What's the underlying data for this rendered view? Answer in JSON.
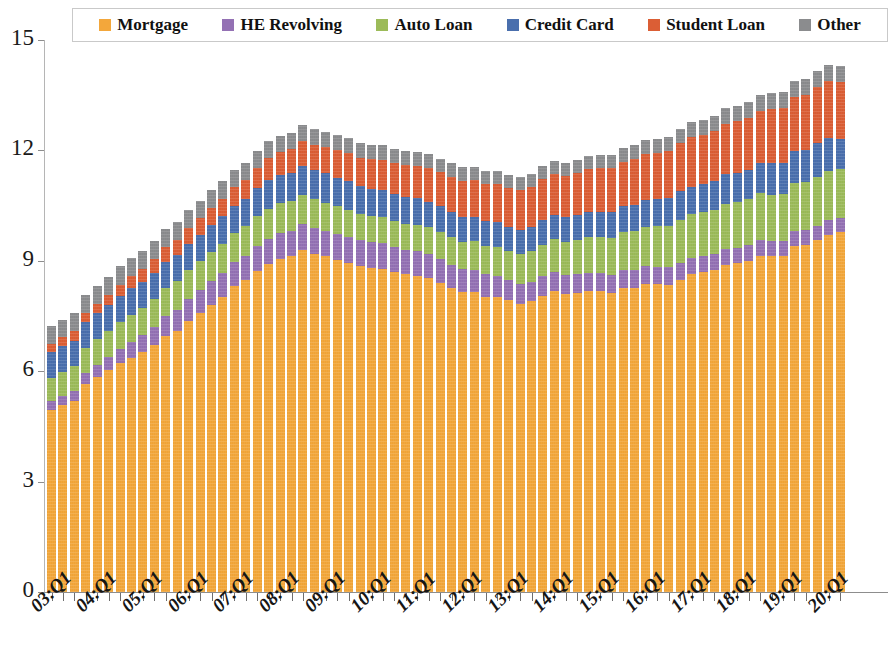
{
  "chart_data": {
    "type": "bar",
    "stacked": true,
    "title": "",
    "subtitle": "",
    "xlabel": "",
    "ylabel": "",
    "ylim": [
      0,
      15
    ],
    "yticks": [
      0,
      3,
      6,
      9,
      12,
      15
    ],
    "ytick_labels": [
      "0",
      "3",
      "6",
      "9",
      "12",
      "15"
    ],
    "grid": false,
    "legend_position": "top",
    "x_tick_labels": [
      "03:Q1",
      "04:Q1",
      "05:Q1",
      "06:Q1",
      "07:Q1",
      "08:Q1",
      "09:Q1",
      "10:Q1",
      "11:Q1",
      "12:Q1",
      "13:Q1",
      "14:Q1",
      "15:Q1",
      "16:Q1",
      "17:Q1",
      "18:Q1",
      "19:Q1",
      "20:Q1"
    ],
    "x_tick_every": 4,
    "categories": [
      "03:Q1",
      "03:Q2",
      "03:Q3",
      "03:Q4",
      "04:Q1",
      "04:Q2",
      "04:Q3",
      "04:Q4",
      "05:Q1",
      "05:Q2",
      "05:Q3",
      "05:Q4",
      "06:Q1",
      "06:Q2",
      "06:Q3",
      "06:Q4",
      "07:Q1",
      "07:Q2",
      "07:Q3",
      "07:Q4",
      "08:Q1",
      "08:Q2",
      "08:Q3",
      "08:Q4",
      "09:Q1",
      "09:Q2",
      "09:Q3",
      "09:Q4",
      "10:Q1",
      "10:Q2",
      "10:Q3",
      "10:Q4",
      "11:Q1",
      "11:Q2",
      "11:Q3",
      "11:Q4",
      "12:Q1",
      "12:Q2",
      "12:Q3",
      "12:Q4",
      "13:Q1",
      "13:Q2",
      "13:Q3",
      "13:Q4",
      "14:Q1",
      "14:Q2",
      "14:Q3",
      "14:Q4",
      "15:Q1",
      "15:Q2",
      "15:Q3",
      "15:Q4",
      "16:Q1",
      "16:Q2",
      "16:Q3",
      "16:Q4",
      "17:Q1",
      "17:Q2",
      "17:Q3",
      "17:Q4",
      "18:Q1",
      "18:Q2",
      "18:Q3",
      "18:Q4",
      "19:Q1",
      "19:Q2",
      "19:Q3",
      "19:Q4",
      "20:Q1",
      "20:Q2"
    ],
    "series": [
      {
        "name": "Mortgage",
        "color": "#F3A73B",
        "values": [
          4.94,
          5.08,
          5.18,
          5.66,
          5.84,
          6.02,
          6.21,
          6.36,
          6.51,
          6.7,
          6.95,
          7.09,
          7.37,
          7.59,
          7.81,
          8.03,
          8.31,
          8.47,
          8.73,
          8.91,
          9.05,
          9.12,
          9.29,
          9.19,
          9.12,
          9.02,
          8.95,
          8.85,
          8.81,
          8.79,
          8.69,
          8.63,
          8.6,
          8.54,
          8.41,
          8.25,
          8.15,
          8.15,
          8.03,
          8.03,
          7.93,
          7.84,
          7.9,
          8.05,
          8.17,
          8.1,
          8.13,
          8.17,
          8.17,
          8.12,
          8.26,
          8.25,
          8.37,
          8.36,
          8.35,
          8.48,
          8.63,
          8.69,
          8.74,
          8.88,
          8.93,
          9.0,
          9.14,
          9.12,
          9.14,
          9.41,
          9.44,
          9.56,
          9.71,
          9.78
        ]
      },
      {
        "name": "HE Revolving",
        "color": "#9471B4",
        "values": [
          0.24,
          0.26,
          0.28,
          0.3,
          0.33,
          0.36,
          0.4,
          0.44,
          0.47,
          0.51,
          0.54,
          0.57,
          0.59,
          0.61,
          0.63,
          0.64,
          0.65,
          0.66,
          0.67,
          0.69,
          0.7,
          0.7,
          0.7,
          0.69,
          0.69,
          0.7,
          0.69,
          0.71,
          0.71,
          0.7,
          0.69,
          0.67,
          0.66,
          0.65,
          0.64,
          0.64,
          0.62,
          0.61,
          0.6,
          0.56,
          0.55,
          0.54,
          0.53,
          0.53,
          0.53,
          0.52,
          0.51,
          0.51,
          0.51,
          0.5,
          0.49,
          0.49,
          0.49,
          0.48,
          0.47,
          0.47,
          0.46,
          0.45,
          0.44,
          0.44,
          0.43,
          0.43,
          0.42,
          0.41,
          0.4,
          0.4,
          0.39,
          0.39,
          0.39,
          0.38
        ]
      },
      {
        "name": "Auto Loan",
        "color": "#9CBB59",
        "values": [
          0.64,
          0.65,
          0.67,
          0.68,
          0.7,
          0.71,
          0.72,
          0.73,
          0.73,
          0.75,
          0.77,
          0.78,
          0.78,
          0.79,
          0.8,
          0.8,
          0.81,
          0.81,
          0.82,
          0.82,
          0.81,
          0.8,
          0.8,
          0.79,
          0.77,
          0.76,
          0.75,
          0.71,
          0.7,
          0.7,
          0.71,
          0.71,
          0.72,
          0.73,
          0.74,
          0.75,
          0.75,
          0.77,
          0.78,
          0.78,
          0.79,
          0.81,
          0.83,
          0.86,
          0.88,
          0.9,
          0.93,
          0.96,
          0.97,
          1.0,
          1.03,
          1.06,
          1.07,
          1.1,
          1.13,
          1.16,
          1.17,
          1.18,
          1.21,
          1.22,
          1.23,
          1.24,
          1.27,
          1.27,
          1.28,
          1.3,
          1.32,
          1.33,
          1.35,
          1.34
        ]
      },
      {
        "name": "Credit Card",
        "color": "#4A6FAD",
        "values": [
          0.69,
          0.69,
          0.7,
          0.7,
          0.7,
          0.7,
          0.71,
          0.72,
          0.71,
          0.71,
          0.72,
          0.73,
          0.72,
          0.72,
          0.73,
          0.74,
          0.73,
          0.73,
          0.75,
          0.79,
          0.78,
          0.78,
          0.8,
          0.81,
          0.8,
          0.78,
          0.77,
          0.76,
          0.74,
          0.73,
          0.73,
          0.73,
          0.72,
          0.69,
          0.69,
          0.7,
          0.68,
          0.67,
          0.67,
          0.68,
          0.66,
          0.66,
          0.67,
          0.68,
          0.66,
          0.67,
          0.68,
          0.7,
          0.68,
          0.7,
          0.71,
          0.73,
          0.71,
          0.73,
          0.75,
          0.78,
          0.76,
          0.76,
          0.78,
          0.81,
          0.8,
          0.81,
          0.84,
          0.87,
          0.85,
          0.87,
          0.87,
          0.93,
          0.89,
          0.82
        ]
      },
      {
        "name": "Student Loan",
        "color": "#DB5E35",
        "values": [
          0.24,
          0.25,
          0.26,
          0.25,
          0.26,
          0.28,
          0.31,
          0.33,
          0.36,
          0.37,
          0.39,
          0.39,
          0.43,
          0.45,
          0.47,
          0.48,
          0.51,
          0.53,
          0.56,
          0.58,
          0.61,
          0.63,
          0.66,
          0.68,
          0.71,
          0.74,
          0.76,
          0.77,
          0.8,
          0.83,
          0.85,
          0.86,
          0.89,
          0.92,
          0.94,
          0.95,
          0.98,
          1.0,
          1.02,
          1.03,
          1.05,
          1.07,
          1.09,
          1.1,
          1.11,
          1.12,
          1.13,
          1.16,
          1.19,
          1.2,
          1.2,
          1.23,
          1.26,
          1.26,
          1.28,
          1.31,
          1.34,
          1.34,
          1.36,
          1.38,
          1.41,
          1.41,
          1.41,
          1.46,
          1.49,
          1.48,
          1.5,
          1.51,
          1.54,
          1.54
        ]
      },
      {
        "name": "Other",
        "color": "#8B8C8E",
        "values": [
          0.47,
          0.47,
          0.48,
          0.48,
          0.49,
          0.5,
          0.5,
          0.5,
          0.49,
          0.49,
          0.49,
          0.49,
          0.48,
          0.48,
          0.48,
          0.47,
          0.46,
          0.46,
          0.46,
          0.46,
          0.45,
          0.44,
          0.44,
          0.43,
          0.42,
          0.41,
          0.41,
          0.4,
          0.39,
          0.39,
          0.38,
          0.38,
          0.37,
          0.37,
          0.36,
          0.36,
          0.36,
          0.35,
          0.35,
          0.35,
          0.35,
          0.35,
          0.35,
          0.35,
          0.35,
          0.35,
          0.35,
          0.36,
          0.36,
          0.36,
          0.37,
          0.38,
          0.38,
          0.38,
          0.39,
          0.39,
          0.4,
          0.4,
          0.41,
          0.41,
          0.41,
          0.42,
          0.42,
          0.42,
          0.42,
          0.43,
          0.43,
          0.44,
          0.44,
          0.44
        ]
      }
    ]
  },
  "legend": {
    "items": [
      {
        "label": "Mortgage",
        "color": "#F3A73B"
      },
      {
        "label": "HE Revolving",
        "color": "#9471B4"
      },
      {
        "label": "Auto Loan",
        "color": "#9CBB59"
      },
      {
        "label": "Credit Card",
        "color": "#4A6FAD"
      },
      {
        "label": "Student Loan",
        "color": "#DB5E35"
      },
      {
        "label": "Other",
        "color": "#8B8C8E"
      }
    ]
  }
}
